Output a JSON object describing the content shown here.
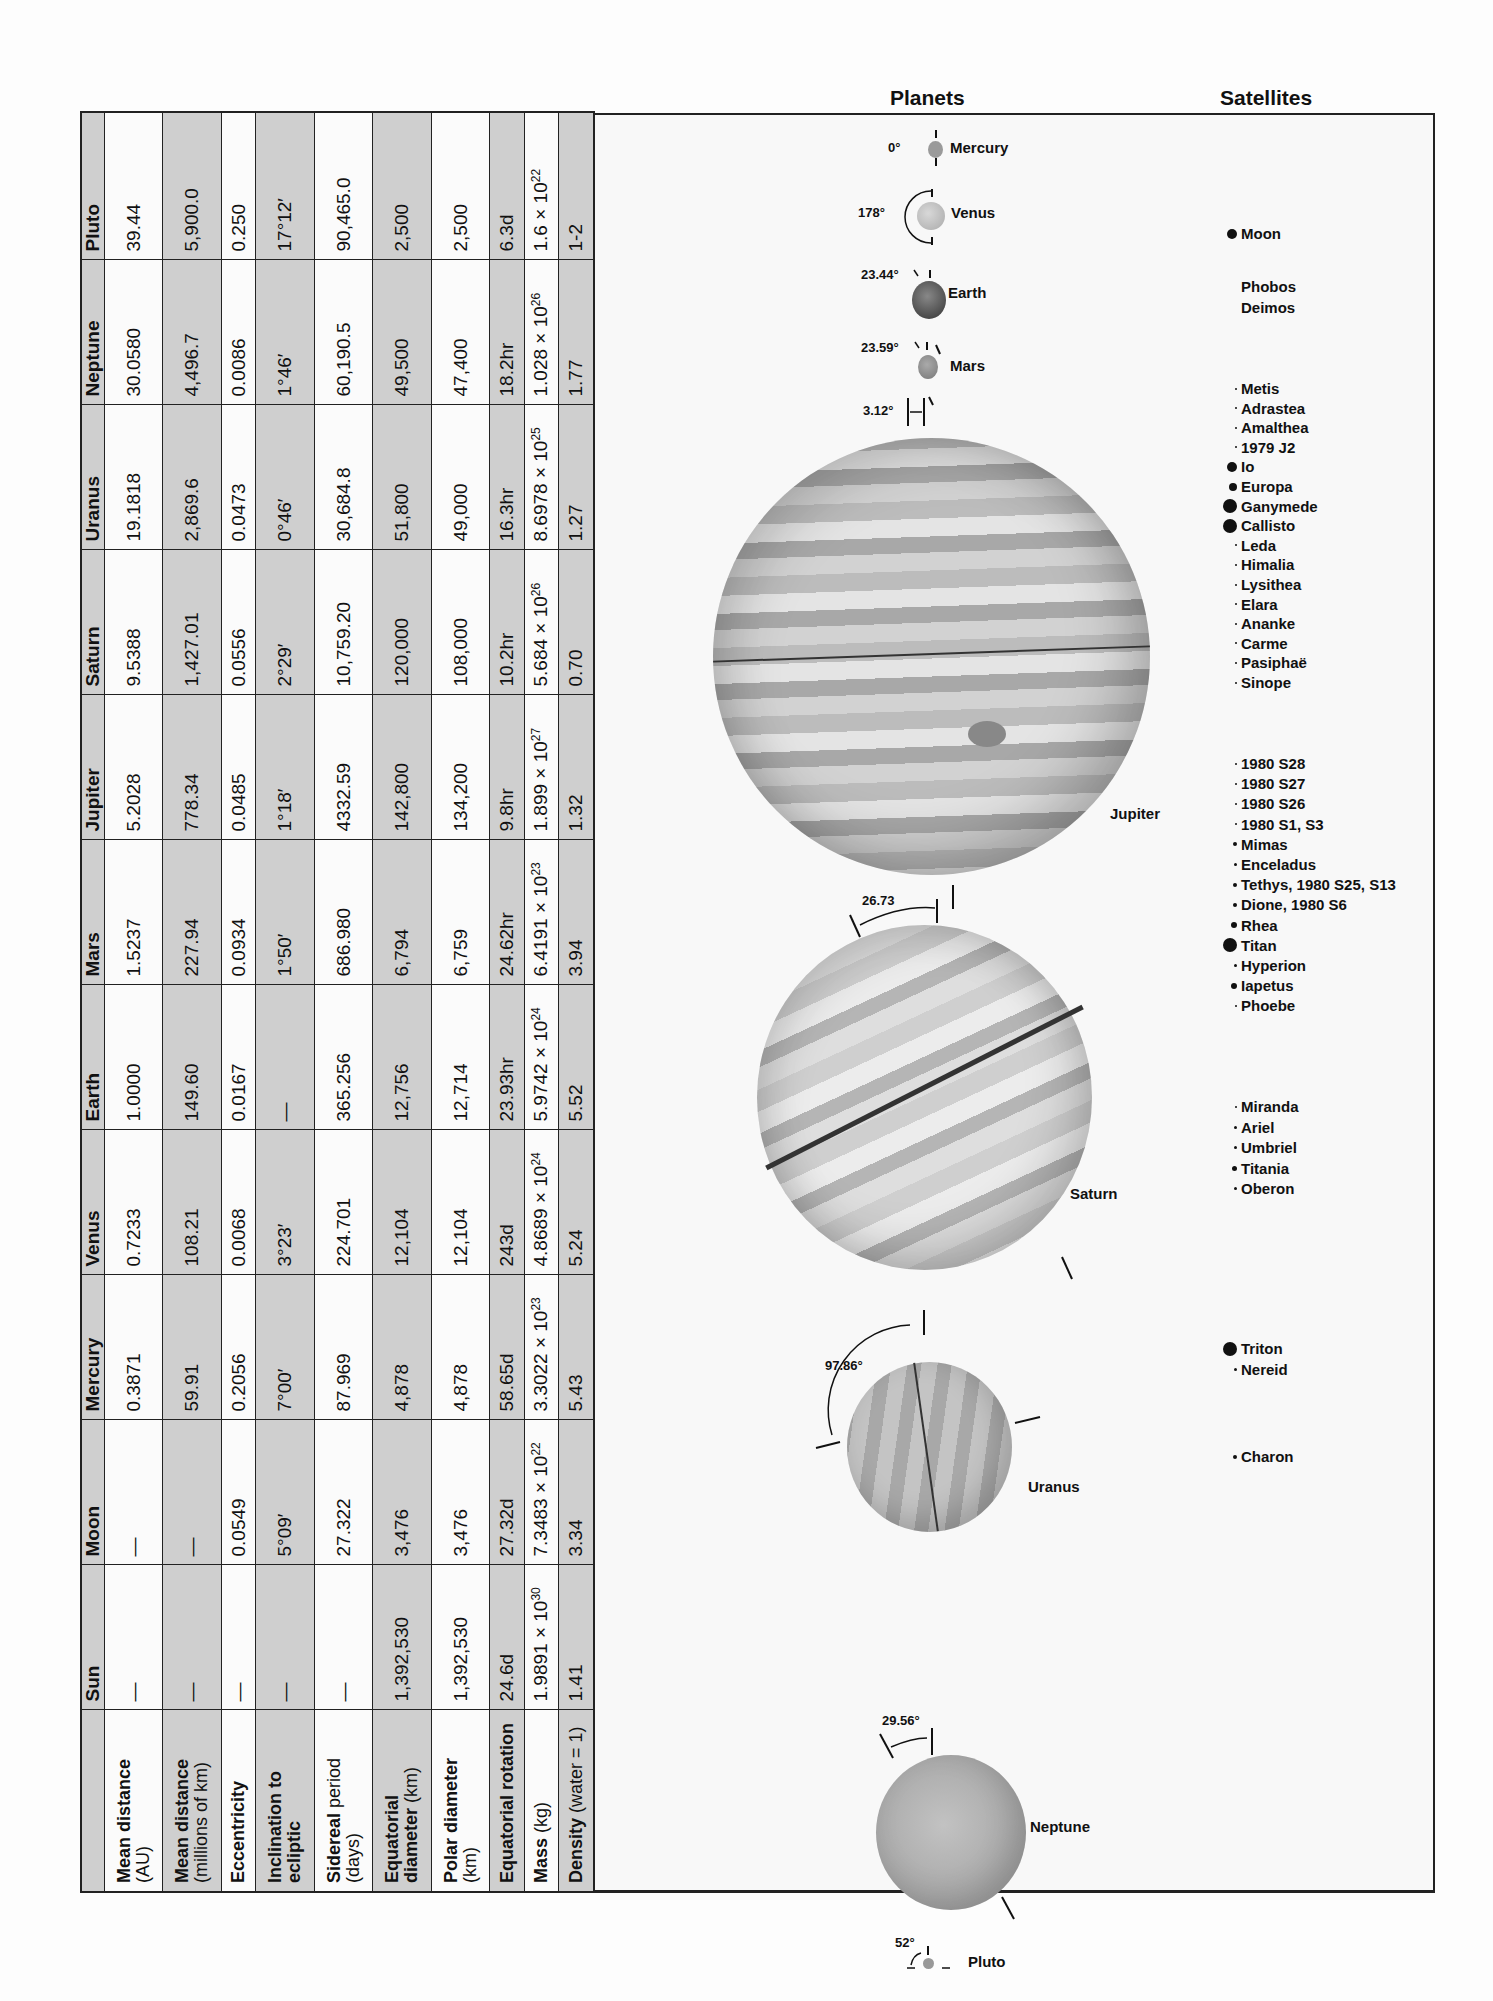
{
  "table": {
    "columns": [
      "Sun",
      "Moon",
      "Mercury",
      "Venus",
      "Earth",
      "Mars",
      "Jupiter",
      "Saturn",
      "Uranus",
      "Neptune",
      "Pluto"
    ],
    "rows": [
      {
        "label": "Mean distance",
        "unit": "(AU)",
        "values": [
          "—",
          "—",
          "0.3871",
          "0.7233",
          "1.0000",
          "1.5237",
          "5.2028",
          "9.5388",
          "19.1818",
          "30.0580",
          "39.44"
        ]
      },
      {
        "label": "Mean distance",
        "unit": "(millions of km)",
        "values": [
          "—",
          "—",
          "59.91",
          "108.21",
          "149.60",
          "227.94",
          "778.34",
          "1,427.01",
          "2,869.6",
          "4,496.7",
          "5,900.0"
        ]
      },
      {
        "label": "Eccentricity",
        "unit": "",
        "values": [
          "—",
          "0.0549",
          "0.2056",
          "0.0068",
          "0.0167",
          "0.0934",
          "0.0485",
          "0.0556",
          "0.0473",
          "0.0086",
          "0.250"
        ]
      },
      {
        "label": "Inclination to ecliptic",
        "unit": "",
        "values": [
          "—",
          "5°09′",
          "7°00′",
          "3°23′",
          "—",
          "1°50′",
          "1°18′",
          "2°29′",
          "0°46′",
          "1°46′",
          "17°12′"
        ]
      },
      {
        "label": "Sidereal",
        "unit": "period (days)",
        "values": [
          "—",
          "27.322",
          "87.969",
          "224.701",
          "365.256",
          "686.980",
          "4332.59",
          "10,759.20",
          "30,684.8",
          "60,190.5",
          "90,465.0"
        ]
      },
      {
        "label": "Equatorial diameter",
        "unit": "(km)",
        "values": [
          "1,392,530",
          "3,476",
          "4,878",
          "12,104",
          "12,756",
          "6,794",
          "142,800",
          "120,000",
          "51,800",
          "49,500",
          "2,500"
        ]
      },
      {
        "label": "Polar diameter",
        "unit": "(km)",
        "values": [
          "1,392,530",
          "3,476",
          "4,878",
          "12,104",
          "12,714",
          "6,759",
          "134,200",
          "108,000",
          "49,000",
          "47,400",
          "2,500"
        ]
      },
      {
        "label": "Equatorial rotation",
        "unit": "",
        "values": [
          "24.6d",
          "27.32d",
          "58.65d",
          "243d",
          "23.93hr",
          "24.62hr",
          "9.8hr",
          "10.2hr",
          "16.3hr",
          "18.2hr",
          "6.3d"
        ]
      },
      {
        "label": "Mass",
        "unit": "(kg)",
        "values": [
          "1.9891 × 10^30",
          "7.3483 × 10^22",
          "3.3022 × 10^23",
          "4.8689 × 10^24",
          "5.9742 × 10^24",
          "6.4191 × 10^23",
          "1.899 × 10^27",
          "5.684 × 10^26",
          "8.6978 × 10^25",
          "1.028 × 10^26",
          "1.6 × 10^22"
        ]
      },
      {
        "label": "Density",
        "unit": "(water = 1)",
        "values": [
          "1.41",
          "3.34",
          "5.43",
          "5.24",
          "5.52",
          "3.94",
          "1.32",
          "0.70",
          "1.27",
          "1.77",
          "1-2"
        ]
      }
    ]
  },
  "panel": {
    "planets_title": "Planets",
    "satellites_title": "Satellites",
    "planets": [
      {
        "name": "Mercury",
        "tilt": "0°"
      },
      {
        "name": "Venus",
        "tilt": "178°"
      },
      {
        "name": "Earth",
        "tilt": "23.44°"
      },
      {
        "name": "Mars",
        "tilt": "23.59°"
      },
      {
        "name": "Jupiter",
        "tilt": "3.12°"
      },
      {
        "name": "Saturn",
        "tilt": "26.73"
      },
      {
        "name": "Uranus",
        "tilt": "97.86°"
      },
      {
        "name": "Neptune",
        "tilt": "29.56°"
      },
      {
        "name": "Pluto",
        "tilt": "52°"
      }
    ],
    "satellites": {
      "earth": [
        "Moon"
      ],
      "mars": [
        "Phobos",
        "Deimos"
      ],
      "jupiter": [
        "Metis",
        "Adrastea",
        "Amalthea",
        "1979 J2",
        "Io",
        "Europa",
        "Ganymede",
        "Callisto",
        "Leda",
        "Himalia",
        "Lysithea",
        "Elara",
        "Ananke",
        "Carme",
        "Pasiphaë",
        "Sinope"
      ],
      "saturn": [
        "1980 S28",
        "1980 S27",
        "1980 S26",
        "1980 S1,  S3",
        "Mimas",
        "Enceladus",
        "Tethys,  1980 S25,  S13",
        "Dione,  1980 S6",
        "Rhea",
        "Titan",
        "Hyperion",
        "Iapetus",
        "Phoebe"
      ],
      "uranus": [
        "Miranda",
        "Ariel",
        "Umbriel",
        "Titania",
        "Oberon"
      ],
      "neptune": [
        "Triton",
        "Nereid"
      ],
      "pluto": [
        "Charon"
      ]
    }
  }
}
